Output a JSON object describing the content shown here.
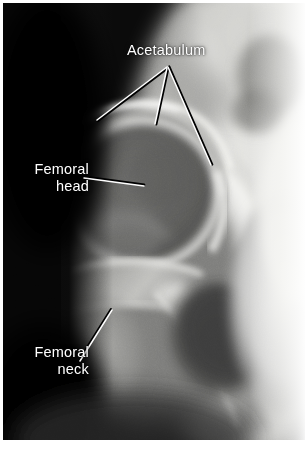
{
  "figure": {
    "kind": "annotated-radiograph",
    "modality": "X-ray",
    "region": "hip joint",
    "view": "anteroposterior",
    "background_color": "#ffffff",
    "film_color": "#000000",
    "label_color": "#ffffff",
    "leader_line_color": "#ffffff",
    "leader_line_shadow_color": "#000000"
  },
  "annotations": [
    {
      "id": "acetabulum",
      "lines": [
        "Acetabulum"
      ],
      "text": "Acetabulum",
      "align": "center",
      "anchor": {
        "x": 167,
        "y": 67
      },
      "leaders": [
        {
          "id": "acetabulum-leader-left",
          "x1": 167,
          "y1": 67,
          "x2": 97,
          "y2": 120
        },
        {
          "id": "acetabulum-leader-middle",
          "x1": 167,
          "y1": 68,
          "x2": 155,
          "y2": 124
        },
        {
          "id": "acetabulum-leader-right",
          "x1": 168,
          "y1": 67,
          "x2": 211,
          "y2": 165
        }
      ]
    },
    {
      "id": "femoral-head",
      "lines": [
        "Femoral",
        "head"
      ],
      "text": "Femoral head",
      "align": "right",
      "anchor": {
        "x": 84,
        "y": 178
      },
      "leaders": [
        {
          "id": "femoral-head-leader",
          "x1": 84,
          "y1": 178,
          "x2": 144,
          "y2": 186
        }
      ]
    },
    {
      "id": "femoral-neck",
      "lines": [
        "Femoral",
        "neck"
      ],
      "text": "Femoral neck",
      "align": "right",
      "anchor": {
        "x": 80,
        "y": 361
      },
      "leaders": [
        {
          "id": "femoral-neck-leader",
          "x1": 80,
          "y1": 361,
          "x2": 112,
          "y2": 310
        }
      ]
    }
  ]
}
